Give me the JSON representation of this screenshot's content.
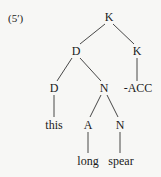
{
  "example_label": "(5′)",
  "tree": {
    "nodes": [
      {
        "id": "k_root",
        "label": "K",
        "x": 109,
        "y": 17
      },
      {
        "id": "d_2",
        "label": "D",
        "x": 76,
        "y": 51
      },
      {
        "id": "k_2",
        "label": "K",
        "x": 137,
        "y": 51
      },
      {
        "id": "d_3",
        "label": "D",
        "x": 54,
        "y": 88
      },
      {
        "id": "n_3",
        "label": "N",
        "x": 104,
        "y": 88
      },
      {
        "id": "acc",
        "label": "-ACC",
        "x": 138,
        "y": 88
      },
      {
        "id": "this",
        "label": "this",
        "x": 54,
        "y": 125
      },
      {
        "id": "a_4",
        "label": "A",
        "x": 88,
        "y": 125
      },
      {
        "id": "n_4",
        "label": "N",
        "x": 120,
        "y": 125
      },
      {
        "id": "long",
        "label": "long",
        "x": 88,
        "y": 161
      },
      {
        "id": "spear",
        "label": "spear",
        "x": 121,
        "y": 161
      }
    ],
    "edges": [
      [
        "k_root",
        "d_2"
      ],
      [
        "k_root",
        "k_2"
      ],
      [
        "d_2",
        "d_3"
      ],
      [
        "d_2",
        "n_3"
      ],
      [
        "k_2",
        "acc"
      ],
      [
        "d_3",
        "this"
      ],
      [
        "n_3",
        "a_4"
      ],
      [
        "n_3",
        "n_4"
      ],
      [
        "a_4",
        "long"
      ],
      [
        "n_4",
        "spear"
      ]
    ]
  }
}
